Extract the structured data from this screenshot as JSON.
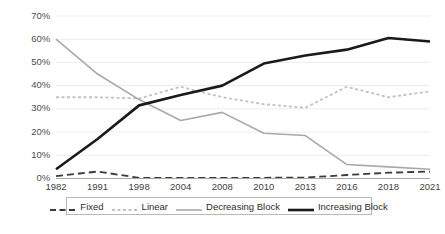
{
  "chart_data": {
    "type": "line",
    "title": "",
    "subtitle": "",
    "xlabel": "",
    "ylabel": "",
    "categories": [
      "1982",
      "1991",
      "1998",
      "2004",
      "2008",
      "2010",
      "2013",
      "2016",
      "2018",
      "2021"
    ],
    "ylim": [
      0,
      70
    ],
    "yticks": [
      0,
      10,
      20,
      30,
      40,
      50,
      60,
      70
    ],
    "ytick_labels": [
      "0%",
      "10%",
      "20%",
      "30%",
      "40%",
      "50%",
      "60%",
      "70%"
    ],
    "grid": "horizontal",
    "legend_position": "bottom",
    "series": [
      {
        "name": "Fixed",
        "values": [
          1,
          3,
          0.3,
          0.3,
          0.3,
          0.3,
          0.4,
          1.5,
          2.5,
          3
        ],
        "color": "#3a3a3a",
        "style": "dashed",
        "width": 1.8
      },
      {
        "name": "Linear",
        "values": [
          35,
          35,
          34.5,
          39.5,
          35,
          32,
          30.5,
          39.5,
          35,
          37.5
        ],
        "color": "#c2c2c2",
        "style": "dotted",
        "width": 1.8
      },
      {
        "name": "Decreasing Block",
        "values": [
          60,
          45,
          34,
          25,
          28.5,
          19.5,
          18.5,
          6,
          5,
          4
        ],
        "color": "#a9a9a9",
        "style": "solid",
        "width": 1.6
      },
      {
        "name": "Increasing Block",
        "values": [
          4,
          17,
          31.5,
          36,
          40,
          49.5,
          53,
          55.5,
          60.5,
          59
        ],
        "color": "#1a1a1a",
        "style": "solid",
        "width": 2.6
      }
    ]
  },
  "legend": {
    "items": [
      {
        "label": "Fixed"
      },
      {
        "label": "Linear"
      },
      {
        "label": "Decreasing Block"
      },
      {
        "label": "Increasing Block"
      }
    ]
  },
  "axes": {
    "y_labels": [
      "70%",
      "60%",
      "50%",
      "40%",
      "30%",
      "20%",
      "10%",
      "0%"
    ],
    "x_labels": [
      "1982",
      "1991",
      "1998",
      "2004",
      "2008",
      "2010",
      "2013",
      "2016",
      "2018",
      "2021"
    ]
  }
}
